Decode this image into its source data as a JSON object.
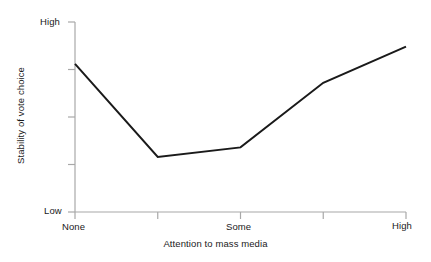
{
  "chart_data": {
    "type": "line",
    "title": "",
    "xlabel": "Attention to mass media",
    "ylabel": "Stability of vote choice",
    "x": [
      0,
      1,
      2,
      3,
      4
    ],
    "categories": [
      "None",
      "",
      "Some",
      "",
      "High"
    ],
    "xtick_labels": [
      "None",
      "",
      "Some",
      "",
      "High"
    ],
    "ytick_labels": [
      "High",
      "",
      "",
      "",
      "Low"
    ],
    "ylim": [
      0,
      1
    ],
    "ytick_values": [
      0,
      0.25,
      0.5,
      0.75,
      1
    ],
    "values": [
      0.78,
      0.29,
      0.34,
      0.68,
      0.87
    ],
    "series": [
      {
        "name": "Stability of vote choice",
        "values": [
          0.78,
          0.29,
          0.34,
          0.68,
          0.87
        ],
        "color": "#1a1a1a"
      }
    ],
    "grid": false,
    "legend": "none",
    "annotations": [],
    "axis_color": "#a8a8a8",
    "background_color": "#ffffff",
    "line_width": 2
  },
  "axes": {
    "y_title": "Stability of vote choice",
    "y_top_label": "High",
    "y_bottom_label": "Low",
    "x_title": "Attention to mass media",
    "x_first_label": "None",
    "x_middle_label": "Some",
    "x_last_label": "High"
  }
}
